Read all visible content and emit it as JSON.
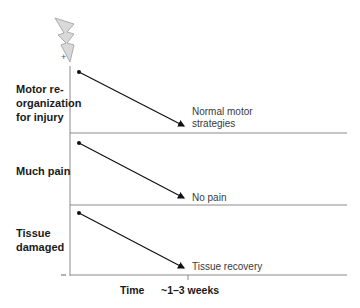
{
  "diagram": {
    "icon": "lightning-bolt-icon",
    "axis": {
      "top_sign": "+",
      "bottom_sign": "–",
      "x_label": "Time",
      "x_tick_label": "~1–3 weeks"
    },
    "panels": [
      {
        "start_label": "Motor re-\norganization\nfor injury",
        "start_lines": [
          "Motor re-",
          "organization",
          "for injury"
        ],
        "end_lines": [
          "Normal motor",
          "strategies"
        ]
      },
      {
        "start_lines": [
          "Much pain"
        ],
        "end_lines": [
          "No pain"
        ]
      },
      {
        "start_lines": [
          "Tissue",
          "damaged"
        ],
        "end_lines": [
          "Tissue recovery"
        ]
      }
    ],
    "colors": {
      "line": "#111111",
      "divider": "#8a8a8a",
      "bolt_fill": "#d9d9d9",
      "bolt_stroke": "#9a9a9a"
    }
  }
}
